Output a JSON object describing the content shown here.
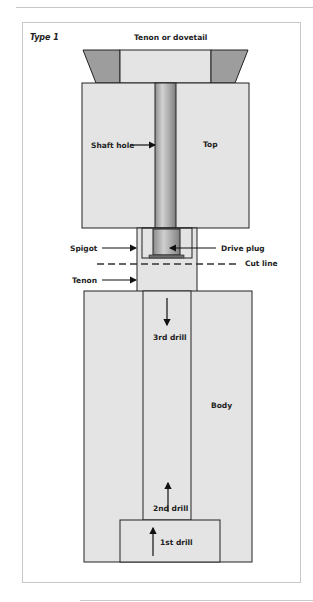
{
  "figure": {
    "type_label": "Type 1",
    "title": "Tenon or dovetail",
    "labels": {
      "shaft_hole": "Shaft hole",
      "top": "Top",
      "spigot": "Spigot",
      "drive_plug": "Drive plug",
      "cut_line": "Cut line",
      "tenon": "Tenon",
      "third_drill": "3rd drill",
      "body": "Body",
      "second_drill": "2nd drill",
      "first_drill": "1st drill"
    },
    "colors": {
      "part_fill": "#e4e4e4",
      "dovetail_fill": "#9d9d9d",
      "outline": "#222222",
      "frame": "#c8c8c8"
    }
  }
}
